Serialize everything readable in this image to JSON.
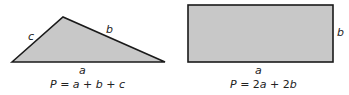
{
  "figures": [
    {
      "shape": "triangle",
      "fill": "#c8c8c8",
      "stroke": "#1a1a1a",
      "side_labels": {
        "base": "a",
        "right_side": "b",
        "left_side": "c"
      },
      "formula": {
        "lhs": "P",
        "eq": " = ",
        "terms": [
          "a",
          " + ",
          "b",
          " + ",
          "c"
        ]
      }
    },
    {
      "shape": "rectangle",
      "fill": "#c8c8c8",
      "stroke": "#1a1a1a",
      "side_labels": {
        "base": "a",
        "right_side": "b"
      },
      "formula": {
        "lhs": "P",
        "eq": " = ",
        "terms": [
          "2",
          "a",
          " + ",
          "2",
          "b"
        ]
      }
    }
  ]
}
